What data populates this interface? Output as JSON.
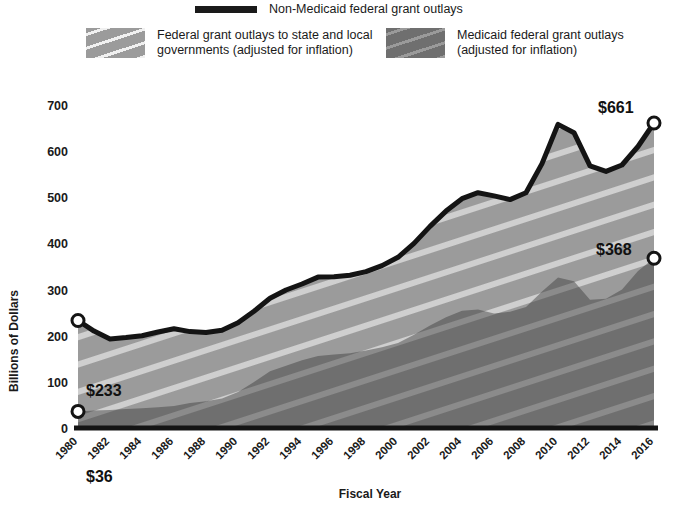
{
  "legend": {
    "line_item": {
      "label": "Non-Medicaid federal grant outlays",
      "color": "#1a1a1a"
    },
    "total_item": {
      "label": "Federal grant outlays to state and local\ngovernments (adjusted for inflation)",
      "color": "#9b9b9b"
    },
    "medicaid_item": {
      "label": "Medicaid federal grant outlays\n(adjusted for inflation)",
      "color": "#6f6f6f"
    }
  },
  "axes": {
    "ylabel": "Billions of Dollars",
    "xlabel": "Fiscal Year",
    "yticks": [
      "700",
      "600",
      "500",
      "400",
      "300",
      "200",
      "100",
      "0"
    ],
    "xticks": [
      "1980",
      "1982",
      "1984",
      "1986",
      "1988",
      "1990",
      "1992",
      "1994",
      "1996",
      "1998",
      "2000",
      "2002",
      "2004",
      "2006",
      "2008",
      "2010",
      "2012",
      "2014",
      "2016"
    ]
  },
  "annotations": {
    "total_start": "$233",
    "medicaid_start": "$36",
    "total_end": "$661",
    "medicaid_end": "$368"
  },
  "chart_data": {
    "type": "area",
    "title": "",
    "xlabel": "Fiscal Year",
    "ylabel": "Billions of Dollars",
    "ylim": [
      0,
      700
    ],
    "xlim": [
      1980,
      2016
    ],
    "grid": false,
    "legend_position": "top",
    "x": [
      1980,
      1981,
      1982,
      1983,
      1984,
      1985,
      1986,
      1987,
      1988,
      1989,
      1990,
      1991,
      1992,
      1993,
      1994,
      1995,
      1996,
      1997,
      1998,
      1999,
      2000,
      2001,
      2002,
      2003,
      2004,
      2005,
      2006,
      2007,
      2008,
      2009,
      2010,
      2011,
      2012,
      2013,
      2014,
      2015,
      2016
    ],
    "series": [
      {
        "name": "Federal grant outlays to state and local governments (adjusted for inflation)",
        "color": "#9b9b9b",
        "values": [
          233,
          210,
          193,
          196,
          200,
          208,
          215,
          209,
          207,
          212,
          228,
          253,
          281,
          299,
          312,
          327,
          328,
          331,
          339,
          352,
          370,
          400,
          437,
          470,
          497,
          510,
          503,
          495,
          510,
          573,
          658,
          640,
          568,
          556,
          570,
          610,
          661
        ]
      },
      {
        "name": "Medicaid federal grant outlays (adjusted for inflation)",
        "color": "#6f6f6f",
        "values": [
          36,
          38,
          39,
          41,
          43,
          45,
          48,
          54,
          58,
          64,
          78,
          100,
          123,
          135,
          147,
          156,
          159,
          162,
          168,
          175,
          184,
          202,
          222,
          240,
          254,
          257,
          248,
          252,
          262,
          296,
          326,
          318,
          278,
          280,
          300,
          340,
          368
        ]
      },
      {
        "name": "Non-Medicaid federal grant outlays",
        "color": "#1a1a1a",
        "note": "outline of total area (upper boundary line)",
        "values": [
          197,
          172,
          154,
          155,
          157,
          163,
          167,
          155,
          149,
          148,
          150,
          153,
          158,
          164,
          165,
          171,
          169,
          169,
          171,
          177,
          186,
          198,
          215,
          230,
          243,
          253,
          255,
          243,
          248,
          277,
          332,
          322,
          290,
          276,
          270,
          270,
          293
        ]
      }
    ],
    "point_labels": [
      {
        "x": 1980,
        "series": "total",
        "value": 233,
        "text": "$233"
      },
      {
        "x": 1980,
        "series": "medicaid",
        "value": 36,
        "text": "$36"
      },
      {
        "x": 2016,
        "series": "total",
        "value": 661,
        "text": "$661"
      },
      {
        "x": 2016,
        "series": "medicaid",
        "value": 368,
        "text": "$368"
      }
    ]
  }
}
